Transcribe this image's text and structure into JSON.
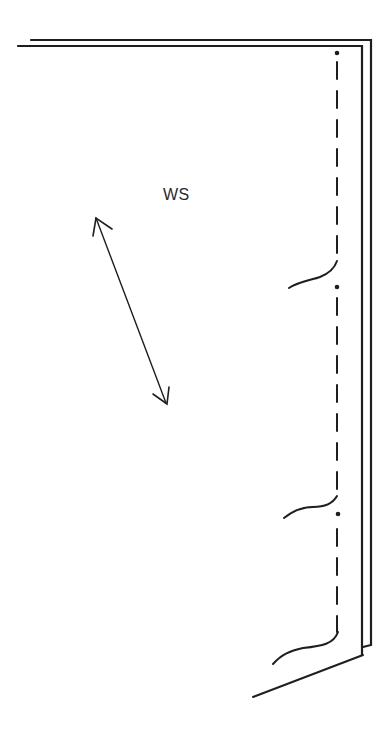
{
  "diagram": {
    "type": "sewing-pattern-piece",
    "label": "WS",
    "colors": {
      "background": "#ffffff",
      "stroke": "#1e1e1e"
    },
    "elements": {
      "outer_edge": "double fold line (top and right edges)",
      "stitch_line": "dash-dot stitching line with marker dots",
      "grainline_arrow": "double-headed grain arrow",
      "cut_marks": 3,
      "marker_dots": 3,
      "bottom_edge": "angled hem edge"
    }
  }
}
